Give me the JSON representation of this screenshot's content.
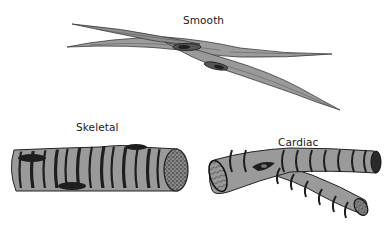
{
  "figure": {
    "labels": {
      "smooth": "Smooth",
      "skeletal": "Skeletal",
      "cardiac": "Cardiac"
    },
    "colors": {
      "cell_fill": "#9a9a9a",
      "band_dark": "#1e1e1e",
      "outline": "#2a2a2a",
      "background": "#ffffff"
    },
    "panels": [
      {
        "name": "smooth",
        "description": "Two spindle-shaped, tapering smooth muscle cells, each with a single central elongated nucleus"
      },
      {
        "name": "skeletal",
        "description": "Cylindrical striated skeletal muscle fiber with multiple peripheral nuclei and a stippled cut end"
      },
      {
        "name": "cardiac",
        "description": "Branched striated cardiac muscle fiber with a central nucleus and intercalated discs"
      }
    ]
  }
}
